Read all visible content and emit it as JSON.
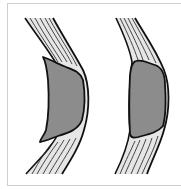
{
  "figure": {
    "colors": {
      "background": "#ffffff",
      "frame_border": "#cfcfcf",
      "band_fill": "#e6e6e6",
      "lesion_fill": "#8c8c8c",
      "outline": "#111111",
      "fiber": "#333333"
    },
    "panels": [
      {
        "id": "left",
        "lesion_shape": "irregular with pointed tips"
      },
      {
        "id": "right",
        "lesion_shape": "rounded"
      }
    ]
  }
}
